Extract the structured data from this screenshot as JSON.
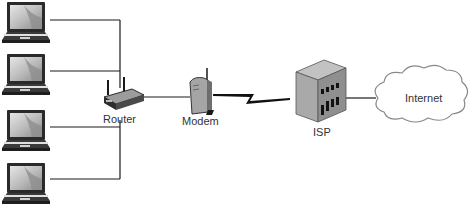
{
  "diagram": {
    "type": "network-topology",
    "nodes": [
      {
        "id": "laptop-1",
        "kind": "laptop",
        "label": ""
      },
      {
        "id": "laptop-2",
        "kind": "laptop",
        "label": ""
      },
      {
        "id": "laptop-3",
        "kind": "laptop",
        "label": ""
      },
      {
        "id": "laptop-4",
        "kind": "laptop",
        "label": ""
      },
      {
        "id": "router",
        "kind": "router",
        "label": "Router"
      },
      {
        "id": "modem",
        "kind": "modem",
        "label": "Modem"
      },
      {
        "id": "isp",
        "kind": "building",
        "label": "ISP"
      },
      {
        "id": "internet",
        "kind": "cloud",
        "label": "Internet"
      }
    ],
    "edges": [
      {
        "from": "laptop-1",
        "to": "router",
        "style": "wired"
      },
      {
        "from": "laptop-2",
        "to": "router",
        "style": "wired"
      },
      {
        "from": "laptop-3",
        "to": "router",
        "style": "wired"
      },
      {
        "from": "laptop-4",
        "to": "router",
        "style": "wired"
      },
      {
        "from": "router",
        "to": "modem",
        "style": "wired"
      },
      {
        "from": "modem",
        "to": "isp",
        "style": "wan-lightning"
      },
      {
        "from": "isp",
        "to": "internet",
        "style": "wired"
      }
    ]
  },
  "labels": {
    "router": "Router",
    "modem": "Modem",
    "isp": "ISP",
    "internet": "Internet"
  },
  "colors": {
    "line": "#1a1a1a",
    "device_gray": "#9a9a9a",
    "screen_light": "#dcdcdc",
    "screen_dark": "#8c8c8c",
    "building": "#a8a8a8",
    "cloud_stroke": "#888888",
    "text": "#333333"
  }
}
